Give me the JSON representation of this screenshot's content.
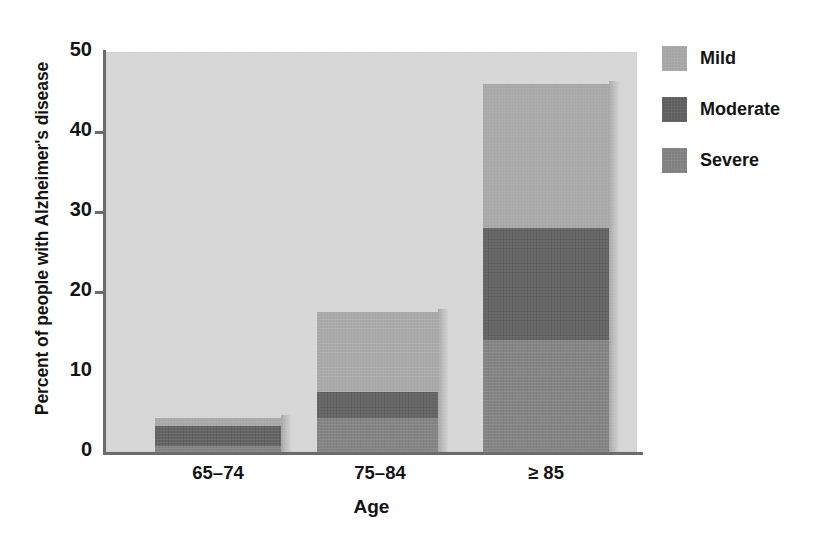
{
  "chart_data": {
    "type": "bar",
    "subtype": "stacked-bar",
    "title": "",
    "xlabel": "Age",
    "ylabel": "Percent of people with Alzheimer's disease",
    "categories": [
      "65–74",
      "75–84",
      "≥ 85"
    ],
    "series": [
      {
        "name": "Mild",
        "values": [
          1.0,
          10.0,
          18.0
        ],
        "color": "#a5a5a5"
      },
      {
        "name": "Moderate",
        "values": [
          2.4,
          3.3,
          14.0
        ],
        "color": "#5d5d5d"
      },
      {
        "name": "Severe",
        "values": [
          0.8,
          4.2,
          14.0
        ],
        "color": "#7f7f7f"
      }
    ],
    "stack_order_bottom_to_top": [
      "Severe",
      "Moderate",
      "Mild"
    ],
    "bar_totals": [
      4.2,
      17.5,
      46.0
    ],
    "ylim": [
      0,
      50
    ],
    "yticks": [
      0,
      10,
      20,
      30,
      40,
      50
    ],
    "ytick_labels": [
      "0",
      "10",
      "20",
      "30",
      "40",
      "50"
    ],
    "grid": false,
    "legend_position": "right",
    "plot_background_color": "#d6d6d6",
    "axis_color": "#6b6b6b",
    "text_color": "#141414"
  },
  "legend": {
    "items": [
      {
        "label": "Mild"
      },
      {
        "label": "Moderate"
      },
      {
        "label": "Severe"
      }
    ]
  },
  "axes": {
    "y_title": "Percent of people with Alzheimer's disease",
    "x_title": "Age",
    "y_ticks": [
      "50",
      "40",
      "30",
      "20",
      "10",
      "0"
    ],
    "x_ticks": [
      "65–74",
      "75–84",
      "≥ 85"
    ]
  }
}
